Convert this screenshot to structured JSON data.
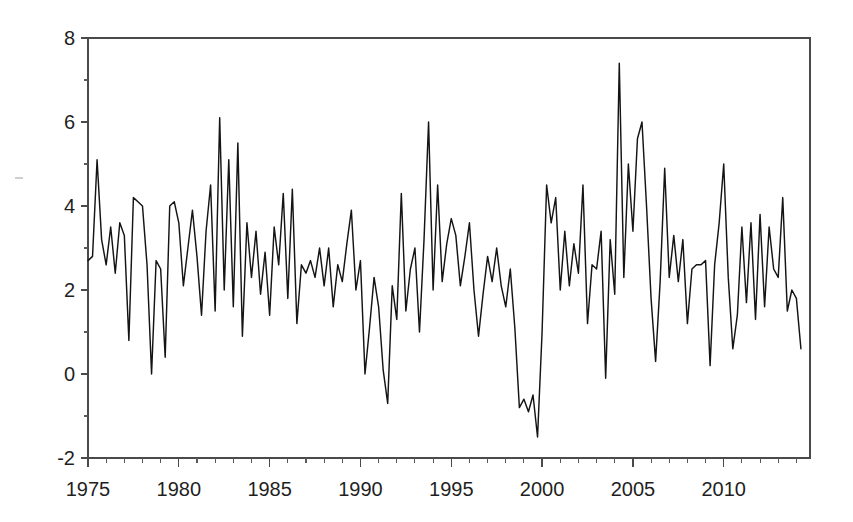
{
  "chart_data": {
    "type": "line",
    "title": "",
    "subtitle": "",
    "xlabel": "",
    "ylabel": "",
    "xlim": [
      1975.0,
      2014.75
    ],
    "ylim": [
      -2,
      8
    ],
    "grid": false,
    "legend": null,
    "x_ticks": [
      1975,
      1980,
      1985,
      1990,
      1995,
      2000,
      2005,
      2010
    ],
    "x_tick_labels": [
      "1975",
      "1980",
      "1985",
      "1990",
      "1995",
      "2000",
      "2005",
      "2010"
    ],
    "x_minor_tick_interval": 1,
    "y_ticks": [
      -2,
      0,
      2,
      4,
      6,
      8
    ],
    "y_tick_labels": [
      "-2",
      "0",
      "2",
      "4",
      "6",
      "8"
    ],
    "series": [
      {
        "name": "series-1",
        "color": "#141414",
        "frequency": "quarterly",
        "x_start": 1975.0,
        "x_step": 0.25,
        "values": [
          2.7,
          2.8,
          5.1,
          3.2,
          2.6,
          3.5,
          2.4,
          3.6,
          3.3,
          0.8,
          4.2,
          4.1,
          4.0,
          2.6,
          0.0,
          2.7,
          2.5,
          0.4,
          4.0,
          4.1,
          3.6,
          2.1,
          3.0,
          3.9,
          2.8,
          1.4,
          3.4,
          4.5,
          1.5,
          6.1,
          2.0,
          5.1,
          1.6,
          5.5,
          0.9,
          3.6,
          2.3,
          3.4,
          1.9,
          2.9,
          1.4,
          3.5,
          2.6,
          4.3,
          1.8,
          4.4,
          1.2,
          2.6,
          2.4,
          2.7,
          2.3,
          3.0,
          2.1,
          3.0,
          1.6,
          2.6,
          2.2,
          3.1,
          3.9,
          2.0,
          2.7,
          0.0,
          1.1,
          2.3,
          1.6,
          0.1,
          -0.7,
          2.1,
          1.3,
          4.3,
          1.5,
          2.5,
          3.0,
          1.0,
          3.2,
          6.0,
          2.0,
          4.5,
          2.2,
          3.1,
          3.7,
          3.3,
          2.1,
          2.8,
          3.6,
          2.0,
          0.9,
          1.9,
          2.8,
          2.2,
          3.0,
          2.1,
          1.6,
          2.5,
          1.1,
          -0.8,
          -0.6,
          -0.9,
          -0.5,
          -1.5,
          1.0,
          4.5,
          3.6,
          4.2,
          2.0,
          3.4,
          2.1,
          3.1,
          2.4,
          4.5,
          1.2,
          2.6,
          2.5,
          3.4,
          -0.1,
          3.2,
          1.9,
          7.4,
          2.3,
          5.0,
          3.4,
          5.6,
          6.0,
          4.0,
          1.8,
          0.3,
          2.2,
          4.9,
          2.3,
          3.3,
          2.2,
          3.2,
          1.2,
          2.5,
          2.6,
          2.6,
          2.7,
          0.2,
          2.6,
          3.6,
          5.0,
          2.3,
          0.6,
          1.4,
          3.5,
          1.7,
          3.6,
          1.3,
          3.8,
          1.6,
          3.5,
          2.5,
          2.3,
          4.2,
          1.5,
          2.0,
          1.8,
          0.6
        ]
      }
    ]
  },
  "axes": {
    "frame": {
      "left_px": 88,
      "right_px": 810,
      "top_px": 38,
      "bottom_px": 458
    }
  }
}
